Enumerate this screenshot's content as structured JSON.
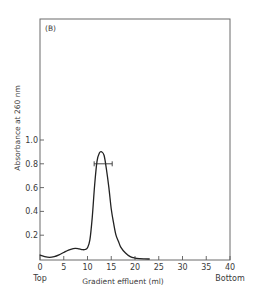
{
  "chart_data": {
    "type": "line",
    "panel_label": "(B)",
    "title": "",
    "xlabel": "Gradient effluent (ml)",
    "ylabel": "Absorbance at 260 nm",
    "xlim": [
      0,
      40
    ],
    "ylim": [
      0,
      1.2
    ],
    "x_ticks": [
      0,
      5,
      10,
      15,
      20,
      25,
      30,
      35,
      40
    ],
    "x_tick_labels": [
      "0",
      "5",
      "10",
      "15",
      "20",
      "25",
      "30",
      "35",
      "40"
    ],
    "y_ticks": [
      0.2,
      0.4,
      0.6,
      0.8,
      1.0
    ],
    "y_tick_labels": [
      "0.2",
      "0.4",
      "0.6",
      "0.8",
      "1.0"
    ],
    "x_end_annotations": {
      "left": "Top",
      "right": "Bottom"
    },
    "grid": false,
    "legend": null,
    "series": [
      {
        "name": "A260 profile",
        "x": [
          0,
          1,
          2,
          3,
          4,
          5,
          6,
          7,
          7.5,
          8,
          8.5,
          9,
          9.5,
          10,
          10.5,
          11,
          11.5,
          12,
          12.5,
          13,
          13.5,
          14,
          14.5,
          15,
          15.5,
          16,
          16.5,
          17,
          18,
          19,
          20,
          21,
          22,
          23
        ],
        "y": [
          0.033,
          0.02,
          0.014,
          0.02,
          0.035,
          0.055,
          0.075,
          0.088,
          0.09,
          0.088,
          0.082,
          0.078,
          0.08,
          0.095,
          0.16,
          0.35,
          0.62,
          0.82,
          0.89,
          0.9,
          0.87,
          0.75,
          0.6,
          0.42,
          0.3,
          0.2,
          0.15,
          0.1,
          0.05,
          0.02,
          0.008,
          0.003,
          0.001,
          0
        ]
      }
    ],
    "annotations": [
      {
        "type": "horizontal_error_bar",
        "y": 0.8,
        "x_center": 13.3,
        "x_min": 11.4,
        "x_max": 15.2
      }
    ]
  }
}
